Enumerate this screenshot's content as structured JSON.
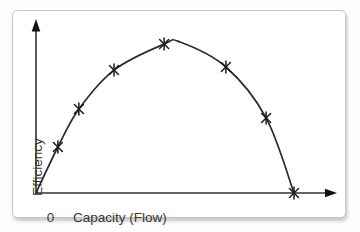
{
  "chart_data": {
    "type": "line",
    "title": "",
    "xlabel": "Capacity (Flow)",
    "ylabel": "Efficiency",
    "origin_tick_label": "0",
    "x_range": [
      0,
      1
    ],
    "y_range": [
      0,
      1
    ],
    "grid": false,
    "legend": false,
    "axes_style": "arrowed, unticked qualitative axes",
    "line_color": "#2b2b2b",
    "marker_color": "#1a1a1a",
    "marker_style": "asterisk",
    "series": [
      {
        "name": "efficiency-vs-capacity-curve",
        "points": [
          [
            0.0,
            0.0
          ],
          [
            0.073,
            0.269
          ],
          [
            0.143,
            0.491
          ],
          [
            0.26,
            0.719
          ],
          [
            0.427,
            0.871
          ],
          [
            0.48,
            0.883
          ],
          [
            0.633,
            0.737
          ],
          [
            0.767,
            0.439
          ],
          [
            0.86,
            0.0
          ]
        ]
      }
    ],
    "marker_points": [
      [
        0.073,
        0.269
      ],
      [
        0.143,
        0.491
      ],
      [
        0.26,
        0.719
      ],
      [
        0.427,
        0.871
      ],
      [
        0.633,
        0.737
      ],
      [
        0.767,
        0.439
      ],
      [
        0.86,
        0.0
      ]
    ]
  }
}
